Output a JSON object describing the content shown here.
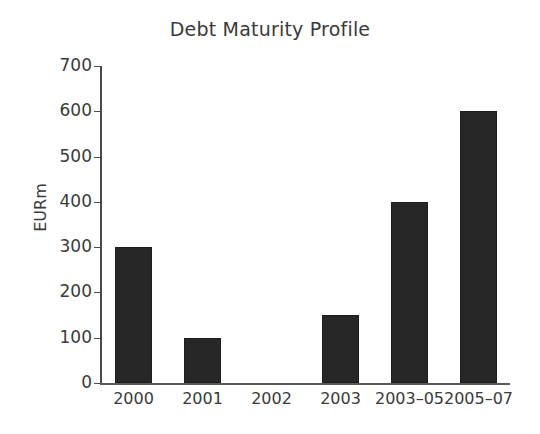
{
  "chart_data": {
    "type": "bar",
    "title": "Debt Maturity Profile",
    "xlabel": "",
    "ylabel": "EURm",
    "categories": [
      "2000",
      "2001",
      "2002",
      "2003",
      "2003–05",
      "2005–07"
    ],
    "values": [
      300,
      100,
      0,
      150,
      400,
      600
    ],
    "ylim": [
      0,
      700
    ],
    "yticks": [
      0,
      100,
      200,
      300,
      400,
      500,
      600,
      700
    ],
    "ytick_labels": [
      "0",
      "100",
      "200",
      "300",
      "400",
      "500",
      "600",
      "700"
    ],
    "grid": false,
    "legend": null,
    "bar_color": "#272727",
    "axis_color": "#4a4a4a",
    "text_color": "#3a3a3a",
    "background_color": "#ffffff"
  }
}
